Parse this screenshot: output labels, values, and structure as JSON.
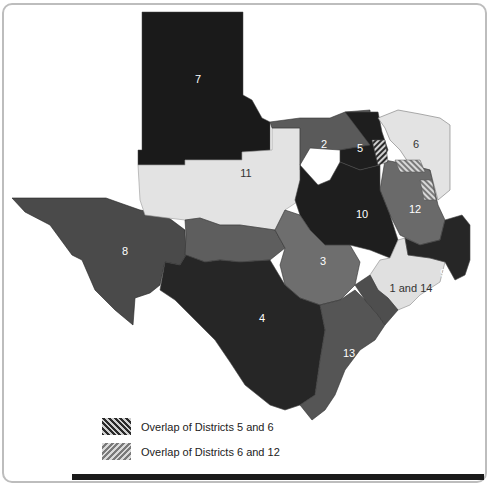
{
  "map": {
    "subject": "Texas districts map",
    "districts": [
      {
        "id": "1 and 14",
        "label": "1 and 14",
        "shade": "#e0e0e0"
      },
      {
        "id": "2",
        "label": "2",
        "shade": "#5a5a5a"
      },
      {
        "id": "3",
        "label": "3",
        "shade": "#6e6e6e"
      },
      {
        "id": "4",
        "label": "4",
        "shade": "#262626"
      },
      {
        "id": "5",
        "label": "5",
        "shade": "#1e1e1e"
      },
      {
        "id": "6",
        "label": "6",
        "shade": "#e3e3e3"
      },
      {
        "id": "7",
        "label": "7",
        "shade": "#1a1a1a"
      },
      {
        "id": "8",
        "label": "8",
        "shade": "#4a4a4a"
      },
      {
        "id": "9",
        "label": "9",
        "shade": "#262626"
      },
      {
        "id": "10",
        "label": "10",
        "shade": "#1e1e1e"
      },
      {
        "id": "11",
        "label": "11",
        "shade": "#e3e3e3"
      },
      {
        "id": "12",
        "label": "12",
        "shade": "#6a6a6a"
      },
      {
        "id": "13",
        "label": "13",
        "shade": "#555555"
      }
    ]
  },
  "legend": {
    "items": [
      {
        "pattern": "dark-hatch",
        "label": "Overlap of Districts 5 and 6"
      },
      {
        "pattern": "light-hatch",
        "label": "Overlap of Districts 6 and 12"
      }
    ]
  }
}
